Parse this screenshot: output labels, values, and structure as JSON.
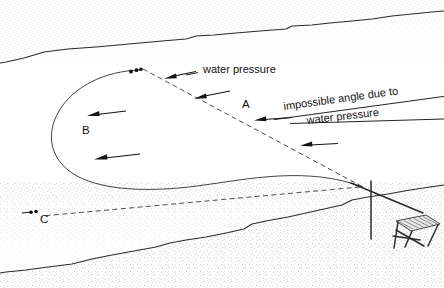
{
  "figure": {
    "background_color": "#ffffff",
    "line_color": "#1c1c1c",
    "stipple_color": "#9a9a9a",
    "width": 444,
    "height": 288
  },
  "labels": {
    "point_a": "A",
    "point_b": "B",
    "point_c": "C"
  },
  "callouts": {
    "water_pressure_top": "water pressure",
    "impossible_line1": "impossible angle due to",
    "impossible_line2": "water pressure"
  },
  "elements": {
    "upper_terrain_name": "upper-terrain-surface",
    "lower_terrain_name": "lower-terrain-surface",
    "trajectory_name": "trajectory-curve",
    "dashed_name": "intended-straight-path",
    "rig_name": "drilling-rig",
    "mast_name": "rig-mast"
  },
  "geometry": {
    "upper_terrain_path": "M 6,62 L 24,58 L 44,52 L 68,49 L 96,47 L 118,45 L 140,43 L 162,41 L 186,39 L 196,36 L 214,35 L 236,33 L 260,31 L 286,29 L 292,26 L 312,25 L 330,23 L 352,21 L 372,19 L 392,16 L 412,14 L 432,12 L 444,11",
    "lower_terrain_path": "M 6,272 L 26,270 L 48,267 L 72,264 L 92,259 L 112,255 L 134,251 L 156,247 L 170,243 L 186,240 L 206,237 L 226,233 L 244,229 L 252,224 L 266,221 L 288,217 L 306,213 L 324,209 L 342,205 L 352,200 L 368,197 L 388,194 L 410,190 L 430,187 L 444,185",
    "trajectory_path": "M 140,70 C 104,72 72,88 58,112 C 44,136 50,162 76,176 C 104,191 150,192 196,186 C 248,179 306,166 363,187",
    "dashed_path_main": "M 142,70 L 363,187",
    "dashed_path_lower": "M 363,187 L 40,216",
    "rig_mast": "M 371,182 L 371,238",
    "rig_tether": "M 352,184 L 424,214",
    "convergence_point": [
      363,
      187
    ]
  },
  "arrows": [
    {
      "name": "arrow-water-pressure-top",
      "tail": [
        196,
        72
      ],
      "head": [
        166,
        78
      ]
    },
    {
      "name": "arrow-dashed-upper",
      "tail": [
        228,
        92
      ],
      "head": [
        196,
        98
      ]
    },
    {
      "name": "arrow-point-a",
      "tail": [
        290,
        118
      ],
      "head": [
        256,
        120
      ]
    },
    {
      "name": "arrow-dashed-lower",
      "tail": [
        336,
        145
      ],
      "head": [
        301,
        145
      ]
    },
    {
      "name": "arrow-curve-upper",
      "tail": [
        124,
        112
      ],
      "head": [
        88,
        116
      ]
    },
    {
      "name": "arrow-curve-lower",
      "tail": [
        138,
        155
      ],
      "head": [
        95,
        159
      ]
    }
  ],
  "dot_markers": [
    {
      "name": "curve-apex-dots",
      "x": 136,
      "y": 70
    },
    {
      "name": "point-c-dots",
      "x": 33,
      "y": 211
    }
  ]
}
